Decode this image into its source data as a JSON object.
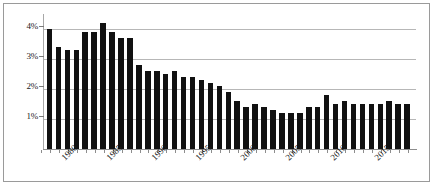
{
  "chart_data": {
    "type": "bar",
    "title": "",
    "subtitle": "",
    "xlabel": "",
    "ylabel": "",
    "grid": true,
    "legend": false,
    "legend_position": "none",
    "bar_color": "#111111",
    "gridline_color": "#b7b7b7",
    "border_color": "#9a9a9a",
    "ylim": [
      0,
      4.5
    ],
    "y_ticks": [
      1,
      2,
      3,
      4
    ],
    "y_tick_labels": [
      "1%",
      "2%",
      "3%",
      "4%"
    ],
    "xlim": [
      1977,
      2017
    ],
    "x_tick_labels": [
      "1980",
      "1985",
      "1990",
      "1995",
      "2000",
      "2005",
      "2010",
      "2015"
    ],
    "x_tick_years": [
      1980,
      1985,
      1990,
      1995,
      2000,
      2005,
      2010,
      2015
    ],
    "categories": [
      "1977",
      "1978",
      "1979",
      "1980",
      "1981",
      "1982",
      "1983",
      "1984",
      "1985",
      "1986",
      "1987",
      "1988",
      "1989",
      "1990",
      "1991",
      "1992",
      "1993",
      "1994",
      "1995",
      "1996",
      "1997",
      "1998",
      "1999",
      "2000",
      "2001",
      "2002",
      "2003",
      "2004",
      "2005",
      "2006",
      "2007",
      "2008",
      "2009",
      "2010",
      "2011",
      "2012",
      "2013",
      "2014",
      "2015",
      "2016",
      "2017"
    ],
    "values": [
      4.0,
      3.4,
      3.3,
      3.3,
      3.9,
      3.9,
      4.2,
      3.9,
      3.7,
      3.7,
      2.8,
      2.6,
      2.6,
      2.5,
      2.6,
      2.4,
      2.4,
      2.3,
      2.2,
      2.1,
      1.9,
      1.6,
      1.4,
      1.5,
      1.4,
      1.3,
      1.2,
      1.2,
      1.2,
      1.4,
      1.4,
      1.8,
      1.5,
      1.6,
      1.5,
      1.5,
      1.5,
      1.5,
      1.6,
      1.5,
      1.5
    ]
  }
}
